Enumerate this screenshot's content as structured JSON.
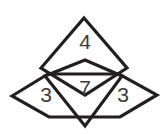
{
  "canvas": {
    "width": 167,
    "height": 134,
    "background_color": "#ffffff",
    "stroke_color": "#231f20",
    "text_color": "#3a3a3a"
  },
  "title": {
    "text": "math",
    "note": "clipped at top edge of image; only the lowest pixel row of the glyphs is visible"
  },
  "figure": {
    "type": "overlapping-rhombus-diagram",
    "labels": {
      "top": "4",
      "center": "7",
      "left": "3",
      "right": "3"
    },
    "shapes": [
      {
        "name": "top-rhombus",
        "label": "4",
        "points": "84,18 127,68 85,95 41,68"
      },
      {
        "name": "horizontal-rhombus",
        "label_left": "3",
        "label_right": "3",
        "points": "12,96 45,76 122,76 157,95 124,116 47,116"
      },
      {
        "name": "center-diamond",
        "label": "7",
        "points": "85,60 122,76 85,126 45,76"
      }
    ]
  }
}
